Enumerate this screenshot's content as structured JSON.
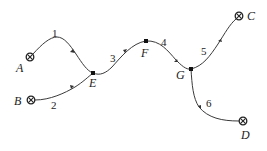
{
  "diagram": {
    "type": "network-flow",
    "nodes": [
      {
        "id": "A",
        "label": "A",
        "kind": "terminal",
        "x": 30,
        "y": 57,
        "lx": 16,
        "ly": 72
      },
      {
        "id": "B",
        "label": "B",
        "kind": "terminal",
        "x": 31,
        "y": 100,
        "lx": 14,
        "ly": 105
      },
      {
        "id": "C",
        "label": "C",
        "kind": "terminal",
        "x": 239,
        "y": 16,
        "lx": 247,
        "ly": 20
      },
      {
        "id": "D",
        "label": "D",
        "kind": "terminal",
        "x": 243,
        "y": 121,
        "lx": 241,
        "ly": 139
      },
      {
        "id": "E",
        "label": "E",
        "kind": "junction",
        "x": 93,
        "y": 73,
        "lx": 89,
        "ly": 87
      },
      {
        "id": "F",
        "label": "F",
        "kind": "junction",
        "x": 146,
        "y": 41,
        "lx": 141,
        "ly": 57
      },
      {
        "id": "G",
        "label": "G",
        "kind": "junction",
        "x": 191,
        "y": 69,
        "lx": 176,
        "ly": 79
      }
    ],
    "edges": [
      {
        "id": "1",
        "label": "1",
        "from": "A",
        "to": "E",
        "lx": 52,
        "ly": 37
      },
      {
        "id": "2",
        "label": "2",
        "from": "B",
        "to": "E",
        "lx": 51,
        "ly": 109
      },
      {
        "id": "3",
        "label": "3",
        "from": "E",
        "to": "F",
        "lx": 110,
        "ly": 62
      },
      {
        "id": "4",
        "label": "4",
        "from": "F",
        "to": "G",
        "lx": 161,
        "ly": 46
      },
      {
        "id": "5",
        "label": "5",
        "from": "G",
        "to": "C",
        "lx": 201,
        "ly": 55
      },
      {
        "id": "6",
        "label": "6",
        "from": "G",
        "to": "D",
        "lx": 206,
        "ly": 107
      }
    ]
  }
}
